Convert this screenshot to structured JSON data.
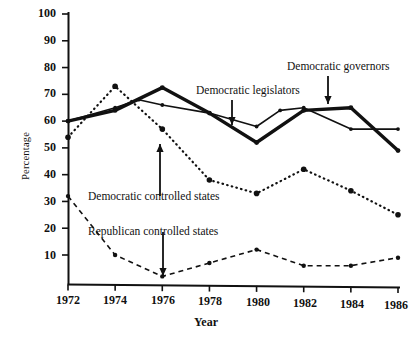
{
  "chart_data": {
    "type": "line",
    "title": "",
    "xlabel": "Year",
    "ylabel": "Percentage",
    "x": [
      1972,
      1974,
      1976,
      1978,
      1980,
      1982,
      1984,
      1986
    ],
    "xlim": [
      1972,
      1986
    ],
    "ylim": [
      0,
      100
    ],
    "ytick_values": [
      10,
      20,
      30,
      40,
      50,
      60,
      70,
      80,
      90,
      100
    ],
    "ytick_labels": [
      "10",
      "20",
      "30",
      "40",
      "50",
      "60",
      "70",
      "80",
      "90",
      "100"
    ],
    "xtick_labels": [
      "1972",
      "1974",
      "1976",
      "1978",
      "1980",
      "1982",
      "1984",
      "1986"
    ],
    "grid": false,
    "legend_position": "inline-annotations",
    "series": [
      {
        "name": "Democratic legislators",
        "style": "solid-thin",
        "marker": "dot",
        "x": [
          1972,
          1974,
          1975,
          1976,
          1978,
          1980,
          1981,
          1982,
          1984,
          1986
        ],
        "values": [
          60,
          65,
          68,
          66,
          63,
          58,
          64,
          65,
          57,
          57
        ]
      },
      {
        "name": "Democratic governors",
        "style": "solid-thick",
        "marker": "dot",
        "x": [
          1972,
          1974,
          1976,
          1978,
          1980,
          1982,
          1984,
          1986
        ],
        "values": [
          60,
          64,
          72.5,
          63,
          52,
          64,
          65,
          49
        ]
      },
      {
        "name": "Democratic controlled states",
        "style": "dotted",
        "marker": "dot",
        "x": [
          1972,
          1974,
          1976,
          1978,
          1980,
          1982,
          1984,
          1986
        ],
        "values": [
          54,
          73,
          57,
          38,
          33,
          42,
          34,
          25
        ]
      },
      {
        "name": "Republican controlled states",
        "style": "dashed",
        "marker": "dot",
        "x": [
          1972,
          1974,
          1976,
          1978,
          1980,
          1982,
          1984,
          1986
        ],
        "values": [
          32,
          10,
          2,
          7,
          12,
          6,
          6,
          9
        ]
      }
    ],
    "annotations": [
      {
        "text": "Democratic governors",
        "target_series": "Democratic governors",
        "arrow": "down"
      },
      {
        "text": "Democratic legislators",
        "target_series": "Democratic legislators",
        "arrow": "down"
      },
      {
        "text": "Democratic controlled states",
        "target_series": "Democratic controlled states",
        "arrow": "up"
      },
      {
        "text": "Republican controlled states",
        "target_series": "Republican controlled states",
        "arrow": "down"
      }
    ]
  },
  "axes": {
    "y_label": "Percentage",
    "x_label": "Year",
    "y_ticks": [
      "100",
      "90",
      "80",
      "70",
      "60",
      "50",
      "40",
      "30",
      "20",
      "10"
    ],
    "x_ticks": [
      "1972",
      "1974",
      "1976",
      "1978",
      "1980",
      "1982",
      "1984",
      "1986"
    ]
  },
  "annotations": {
    "governors": "Democratic governors",
    "legislators": "Democratic legislators",
    "dem_states": "Democratic controlled states",
    "rep_states": "Republican controlled states"
  },
  "colors": {
    "ink": "#111111",
    "background": "#ffffff"
  }
}
